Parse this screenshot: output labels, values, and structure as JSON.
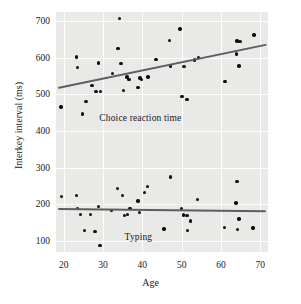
{
  "chart_data": {
    "type": "scatter",
    "title": "",
    "xlabel": "Age",
    "ylabel": "Interkey interval (ms)",
    "xlim": [
      18,
      72
    ],
    "ylim": [
      70,
      725
    ],
    "xticks": [
      20,
      30,
      40,
      50,
      60,
      70
    ],
    "yticks": [
      100,
      200,
      300,
      400,
      500,
      600,
      700
    ],
    "grid": true,
    "legend_position": "inline-annotation",
    "colors": {
      "point": "#0d0d0d",
      "trendline": "#5e5e5e",
      "plot_background": "#e9e9e7",
      "gridline": "#fdfdfc"
    },
    "annotations": [
      {
        "text": "Choice reaction time",
        "x": 39.5,
        "y": 437
      },
      {
        "text": "Typing",
        "x": 39.0,
        "y": 112
      }
    ],
    "series": [
      {
        "name": "Choice reaction time",
        "points": [
          [
            19.3,
            466
          ],
          [
            23.2,
            602
          ],
          [
            23.4,
            573
          ],
          [
            24.8,
            447
          ],
          [
            25.6,
            480
          ],
          [
            27.2,
            525
          ],
          [
            28.2,
            508
          ],
          [
            28.9,
            586
          ],
          [
            29.3,
            508
          ],
          [
            32.4,
            558
          ],
          [
            33.8,
            625
          ],
          [
            34.2,
            708
          ],
          [
            34.6,
            585
          ],
          [
            35.2,
            510
          ],
          [
            36.1,
            548
          ],
          [
            36.6,
            541
          ],
          [
            38.9,
            519
          ],
          [
            39.4,
            545
          ],
          [
            39.8,
            541
          ],
          [
            41.4,
            548
          ],
          [
            43.5,
            596
          ],
          [
            46.9,
            648
          ],
          [
            47.2,
            578
          ],
          [
            49.6,
            679
          ],
          [
            50.1,
            494
          ],
          [
            50.6,
            577
          ],
          [
            51.4,
            487
          ],
          [
            53.3,
            594
          ],
          [
            54.3,
            601
          ],
          [
            61.0,
            535
          ],
          [
            63.9,
            610
          ],
          [
            64.1,
            646
          ],
          [
            64.6,
            578
          ],
          [
            64.9,
            645
          ],
          [
            68.4,
            662
          ]
        ],
        "trend": {
          "x1": 18.5,
          "y1": 520,
          "x2": 71.5,
          "y2": 638
        }
      },
      {
        "name": "Typing",
        "points": [
          [
            19.4,
            222
          ],
          [
            23.2,
            225
          ],
          [
            23.5,
            189
          ],
          [
            24.2,
            172
          ],
          [
            25.3,
            128
          ],
          [
            26.8,
            173
          ],
          [
            27.9,
            126
          ],
          [
            28.8,
            195
          ],
          [
            29.2,
            87
          ],
          [
            32.2,
            184
          ],
          [
            33.6,
            243
          ],
          [
            34.9,
            224
          ],
          [
            35.5,
            169
          ],
          [
            36.2,
            172
          ],
          [
            36.8,
            188
          ],
          [
            38.9,
            209
          ],
          [
            39.3,
            178
          ],
          [
            40.5,
            232
          ],
          [
            41.3,
            248
          ],
          [
            45.5,
            133
          ],
          [
            47.1,
            275
          ],
          [
            49.9,
            188
          ],
          [
            50.4,
            171
          ],
          [
            51.4,
            170
          ],
          [
            51.5,
            128
          ],
          [
            52.3,
            155
          ],
          [
            54.1,
            213
          ],
          [
            60.9,
            137
          ],
          [
            63.8,
            204
          ],
          [
            64.1,
            262
          ],
          [
            64.3,
            131
          ],
          [
            64.6,
            160
          ],
          [
            68.2,
            135
          ]
        ],
        "trend": {
          "x1": 18.5,
          "y1": 190,
          "x2": 71.5,
          "y2": 184
        }
      }
    ]
  }
}
